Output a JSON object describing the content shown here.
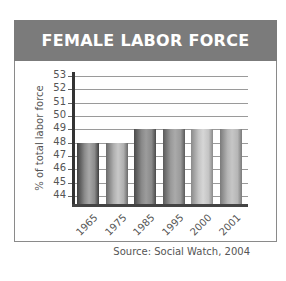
{
  "header": {
    "title": "FEMALE LABOR FORCE"
  },
  "source": "Source: Social Watch, 2004",
  "colors": {
    "header_bg": "#7b7b7b",
    "header_text": "#ffffff",
    "grid": "#9a9a9a",
    "axis": "#333333",
    "text": "#555555"
  },
  "chart_data": {
    "type": "bar",
    "title": "FEMALE LABOR FORCE",
    "xlabel": "",
    "ylabel": "% of total labor force",
    "categories": [
      "1965",
      "1975",
      "1985",
      "1995",
      "2000",
      "2001"
    ],
    "values": [
      48,
      48,
      49,
      49,
      49,
      49
    ],
    "ylim": [
      44,
      53
    ],
    "yticks": [
      44,
      45,
      46,
      47,
      48,
      49,
      50,
      51,
      52,
      53
    ],
    "grid": true,
    "legend": null,
    "annotations": [
      "Source: Social Watch, 2004"
    ],
    "bar_styles": [
      {
        "dark": "#3e3e3e",
        "mid": "#8c8c8c",
        "light": "#a8a8a8"
      },
      {
        "dark": "#6a6a6a",
        "mid": "#b0b0b0",
        "light": "#c8c8c8"
      },
      {
        "dark": "#4a4a4a",
        "mid": "#8a8a8a",
        "light": "#9c9c9c"
      },
      {
        "dark": "#5a5a5a",
        "mid": "#9a9a9a",
        "light": "#aaaaaa"
      },
      {
        "dark": "#8a8a8a",
        "mid": "#c4c4c4",
        "light": "#d6d6d6"
      },
      {
        "dark": "#7a7a7a",
        "mid": "#b6b6b6",
        "light": "#c6c6c6"
      }
    ]
  }
}
